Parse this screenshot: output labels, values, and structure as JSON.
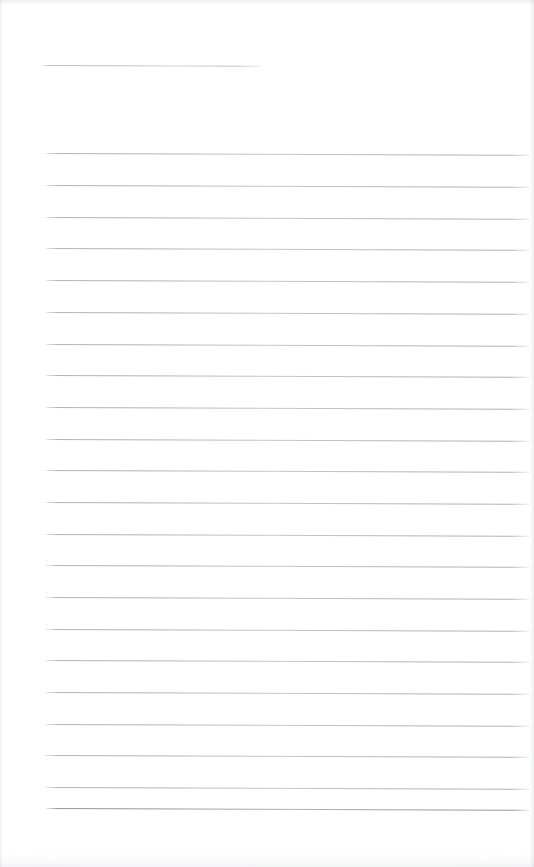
{
  "document": {
    "kind": "scanned-ruled-notepad-page",
    "title_text": "",
    "body_text": "",
    "page_width": 534,
    "page_height": 867,
    "background_color": "#ffffff",
    "rule_color": "#a9aab2",
    "rule_thickness_px": 1,
    "rule_spacing_px": 31.7,
    "rule_left_px": 45,
    "rule_right_px": 529,
    "is_blank": true
  },
  "title_rule": {
    "label": "title-rule",
    "x_start": 42,
    "x_end": 262,
    "y": 65,
    "tilt_deg": 0.22
  },
  "rules": [
    {
      "index": 1,
      "y": 153,
      "x_start": 45,
      "x_end": 529,
      "tilt_deg": 0.22
    },
    {
      "index": 2,
      "y": 185,
      "x_start": 45,
      "x_end": 529,
      "tilt_deg": 0.22
    },
    {
      "index": 3,
      "y": 217,
      "x_start": 45,
      "x_end": 529,
      "tilt_deg": 0.22
    },
    {
      "index": 4,
      "y": 248,
      "x_start": 45,
      "x_end": 529,
      "tilt_deg": 0.22
    },
    {
      "index": 5,
      "y": 280,
      "x_start": 45,
      "x_end": 529,
      "tilt_deg": 0.22
    },
    {
      "index": 6,
      "y": 312,
      "x_start": 45,
      "x_end": 529,
      "tilt_deg": 0.22
    },
    {
      "index": 7,
      "y": 344,
      "x_start": 45,
      "x_end": 529,
      "tilt_deg": 0.22
    },
    {
      "index": 8,
      "y": 375,
      "x_start": 45,
      "x_end": 529,
      "tilt_deg": 0.22
    },
    {
      "index": 9,
      "y": 407,
      "x_start": 45,
      "x_end": 529,
      "tilt_deg": 0.22
    },
    {
      "index": 10,
      "y": 439,
      "x_start": 45,
      "x_end": 529,
      "tilt_deg": 0.22
    },
    {
      "index": 11,
      "y": 470,
      "x_start": 45,
      "x_end": 529,
      "tilt_deg": 0.22
    },
    {
      "index": 12,
      "y": 502,
      "x_start": 45,
      "x_end": 529,
      "tilt_deg": 0.22
    },
    {
      "index": 13,
      "y": 534,
      "x_start": 45,
      "x_end": 529,
      "tilt_deg": 0.22
    },
    {
      "index": 14,
      "y": 565,
      "x_start": 45,
      "x_end": 529,
      "tilt_deg": 0.22
    },
    {
      "index": 15,
      "y": 597,
      "x_start": 45,
      "x_end": 529,
      "tilt_deg": 0.22
    },
    {
      "index": 16,
      "y": 629,
      "x_start": 45,
      "x_end": 529,
      "tilt_deg": 0.22
    },
    {
      "index": 17,
      "y": 660,
      "x_start": 45,
      "x_end": 529,
      "tilt_deg": 0.22
    },
    {
      "index": 18,
      "y": 692,
      "x_start": 45,
      "x_end": 529,
      "tilt_deg": 0.22
    },
    {
      "index": 19,
      "y": 724,
      "x_start": 45,
      "x_end": 529,
      "tilt_deg": 0.22
    },
    {
      "index": 20,
      "y": 755,
      "x_start": 45,
      "x_end": 529,
      "tilt_deg": 0.22
    },
    {
      "index": 21,
      "y": 787,
      "x_start": 45,
      "x_end": 529,
      "tilt_deg": 0.22
    },
    {
      "index": 22,
      "y": 808,
      "x_start": 46,
      "x_end": 529,
      "tilt_deg": 0.22,
      "emphasis": "strong"
    }
  ]
}
